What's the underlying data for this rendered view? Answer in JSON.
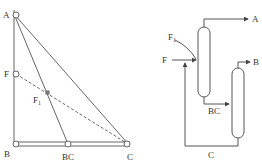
{
  "left_diagram": {
    "type": "ternary_triangle",
    "vertices": {
      "A": "A",
      "B": "B",
      "C": "C"
    },
    "points": {
      "F": "F",
      "F1": "F",
      "F1_sub": "1",
      "BC": "BC"
    },
    "notes": "Right triangle A-B-C with line A to BC and dashed line F to C through F1"
  },
  "right_diagram": {
    "type": "distillation_flowsheet",
    "streams": {
      "feed": "F",
      "mixed_feed": "F",
      "mixed_feed_sub": "1",
      "top_product": "A",
      "bottoms_1": "BC",
      "top_product_2": "B",
      "recycle": "C"
    }
  },
  "colors": {
    "line": "#555555",
    "text": "#333333"
  }
}
